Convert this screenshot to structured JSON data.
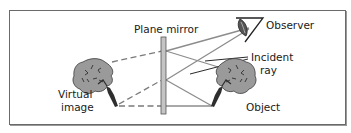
{
  "diagram": {
    "type": "plane-mirror-reflection",
    "labels": {
      "mirror": "Plane mirror",
      "observer": "Observer",
      "incident_ray_line1": "Incident",
      "incident_ray_line2": "ray",
      "object": "Object",
      "virtual_image_line1": "Virtual",
      "virtual_image_line2": "image"
    },
    "colors": {
      "frame": "#6a6a6a",
      "ray": "#8c8c8c",
      "dashed_ray": "#7a7a7a",
      "pointer": "#2a2a2a",
      "mirror_fill": "#c4c4c4",
      "mirror_stroke": "#555555",
      "tree_fill": "#9a9a9a",
      "tree_dark": "#2e2e2e"
    }
  }
}
